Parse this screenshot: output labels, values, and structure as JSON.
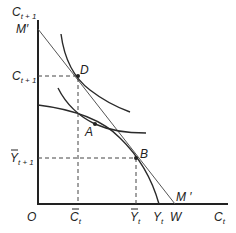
{
  "diagram": {
    "type": "intertemporal-consumption",
    "axes": {
      "y_label": {
        "main": "C",
        "sub": "t + 1"
      },
      "x_label": {
        "main": "C",
        "sub": "t"
      },
      "origin_label": "O"
    },
    "budget_line": {
      "label_top": "M′",
      "label_bottom": "M ′"
    },
    "points": [
      {
        "id": "D",
        "label": "D"
      },
      {
        "id": "A",
        "label": "A"
      },
      {
        "id": "B",
        "label": "B"
      }
    ],
    "y_ticks": [
      {
        "main": "C",
        "sub": "t + 1",
        "bar": false
      },
      {
        "main": "Y",
        "sub": "t + 1",
        "bar": true
      }
    ],
    "x_ticks": [
      {
        "main": "C",
        "sub": "t",
        "bar": true
      },
      {
        "main": "Y",
        "sub": "t",
        "bar": true
      },
      {
        "main": "Y",
        "sub": "t",
        "bar": false
      },
      {
        "main": "W",
        "sub": "",
        "bar": false
      }
    ]
  }
}
